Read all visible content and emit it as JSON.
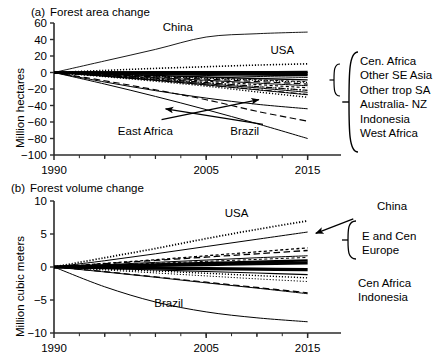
{
  "figure": {
    "width": 442,
    "height": 359,
    "background": "#ffffff",
    "line_color": "#000000"
  },
  "chart_data": [
    {
      "type": "line",
      "panel_tag": "(a)",
      "title": "Forest area change",
      "xlabel": "",
      "ylabel": "Million hectares",
      "xlim": [
        1990,
        2017.5
      ],
      "ylim": [
        -100,
        60
      ],
      "yticks": [
        60,
        40,
        20,
        0,
        -20,
        -40,
        -60,
        -80,
        -100
      ],
      "ytick_labels": [
        "60",
        "40",
        "20",
        "0",
        "−20",
        "−40",
        "−60",
        "−80",
        "−100"
      ],
      "xticks": [
        1990,
        2005,
        2015
      ],
      "xtick_labels": [
        "1990",
        "2005",
        "2015"
      ],
      "xminor_ticks": [
        1995,
        2000,
        2010
      ],
      "grid": false,
      "legend_position": "right-brace",
      "x": [
        1990,
        1995,
        2000,
        2005,
        2010,
        2015
      ],
      "series": [
        {
          "name": "China",
          "style": "solid",
          "width": 0.9,
          "values": [
            0,
            14,
            28,
            43,
            47,
            49
          ]
        },
        {
          "name": "USA",
          "style": "dotted",
          "width": 1.6,
          "values": [
            0,
            2.5,
            5,
            7,
            9,
            10.5
          ]
        },
        {
          "name": "Cen. Africa",
          "style": "solid",
          "width": 1.0,
          "values": [
            0,
            -1.2,
            -2.4,
            -3.6,
            -4.8,
            -6.0
          ]
        },
        {
          "name": "Other SE Asia",
          "style": "dashed-long",
          "width": 1.2,
          "values": [
            0,
            -2.6,
            -5.2,
            -8.0,
            -11.0,
            -14.0
          ]
        },
        {
          "name": "Other trop SA",
          "style": "dashed-short",
          "width": 1.2,
          "values": [
            0,
            -3.4,
            -7.0,
            -10.6,
            -14.6,
            -18.5
          ]
        },
        {
          "name": "Australia- NZ",
          "style": "dash-dot",
          "width": 1.1,
          "values": [
            0,
            -3.6,
            -7.6,
            -12.2,
            -17.0,
            -21.5
          ]
        },
        {
          "name": "Indonesia",
          "style": "dotted",
          "width": 1.4,
          "values": [
            0,
            -5.0,
            -10.5,
            -16.5,
            -23.5,
            -30.0
          ]
        },
        {
          "name": "West Africa",
          "style": "solid",
          "width": 1.0,
          "values": [
            0,
            -4.5,
            -9.5,
            -15.0,
            -21.0,
            -27.0
          ]
        },
        {
          "name": "East Africa",
          "style": "solid",
          "width": 1.0,
          "values": [
            0,
            -11.5,
            -22.0,
            -31.0,
            -38.5,
            -44.0
          ]
        },
        {
          "name": "Brazil",
          "style": "dashed-long",
          "width": 1.1,
          "values": [
            0,
            -10.0,
            -21.0,
            -33.0,
            -47.0,
            -59.0
          ]
        },
        {
          "name": "Brazil (lower)",
          "style": "solid",
          "width": 1.0,
          "values": [
            0,
            -14.0,
            -29.0,
            -45.0,
            -62.0,
            -80.0
          ]
        },
        {
          "name": "bundle-1",
          "style": "solid",
          "width": 2.6,
          "values": [
            0,
            -0.6,
            -1.2,
            -1.8,
            -2.4,
            -3.0
          ]
        },
        {
          "name": "bundle-2",
          "style": "solid",
          "width": 2.6,
          "values": [
            0,
            -0.2,
            -0.4,
            -0.6,
            -0.8,
            -1.0
          ]
        },
        {
          "name": "bundle-3",
          "style": "solid",
          "width": 2.2,
          "values": [
            0,
            0.2,
            0.4,
            0.5,
            0.6,
            0.7
          ]
        },
        {
          "name": "bundle-4",
          "style": "solid",
          "width": 1.4,
          "values": [
            0,
            -1.8,
            -3.6,
            -5.4,
            -7.2,
            -9.0
          ]
        },
        {
          "name": "bundle-5",
          "style": "dotted",
          "width": 1.2,
          "values": [
            0,
            -2.2,
            -4.6,
            -7.0,
            -9.4,
            -12.0
          ]
        },
        {
          "name": "bundle-6",
          "style": "dashed-short",
          "width": 1.0,
          "values": [
            0,
            -2.0,
            -4.2,
            -6.4,
            -8.8,
            -11.2
          ]
        },
        {
          "name": "bundle-7",
          "style": "solid",
          "width": 1.0,
          "values": [
            0,
            -3.0,
            -6.2,
            -9.4,
            -12.8,
            -16.0
          ]
        },
        {
          "name": "bundle-8",
          "style": "dotted",
          "width": 1.2,
          "values": [
            0,
            -3.8,
            -8.0,
            -12.4,
            -17.0,
            -21.8
          ]
        },
        {
          "name": "bundle-9",
          "style": "solid",
          "width": 1.0,
          "values": [
            0,
            -4.2,
            -8.8,
            -13.6,
            -18.6,
            -24.0
          ]
        },
        {
          "name": "bundle-10",
          "style": "dash-dot",
          "width": 1.0,
          "values": [
            0,
            -4.6,
            -9.6,
            -15.0,
            -20.6,
            -26.5
          ]
        }
      ],
      "inline_labels": [
        {
          "text": "China",
          "x": 2002.2,
          "y": 50.5
        },
        {
          "text": "USA",
          "x": 2012.5,
          "y": 22.0
        },
        {
          "text": "East Africa",
          "x": 1999.0,
          "y": -76.0
        },
        {
          "text": "Brazil",
          "x": 2008.8,
          "y": -76.0
        }
      ],
      "right_labels": [
        "Cen. Africa",
        "Other SE Asia",
        "Other trop SA",
        "Australia- NZ",
        "Indonesia",
        "West Africa"
      ],
      "arrows": [
        {
          "from": [
            2000.6,
            -57.0
          ],
          "to": [
            2010.2,
            -33.0
          ]
        },
        {
          "from": [
            2010.6,
            -63.0
          ],
          "to": [
            2001.0,
            -44.0
          ]
        }
      ]
    },
    {
      "type": "line",
      "panel_tag": "(b)",
      "title": "Forest volume change",
      "xlabel": "",
      "ylabel": "Million cubic meters",
      "xlim": [
        1990,
        2017.5
      ],
      "ylim": [
        -10,
        10
      ],
      "yticks": [
        10,
        5,
        0,
        -5,
        -10
      ],
      "ytick_labels": [
        "10",
        "5",
        "0",
        "−5",
        "−10"
      ],
      "xticks": [
        1990,
        2005,
        2015
      ],
      "xtick_labels": [
        "1990",
        "2005",
        "2015"
      ],
      "xminor_ticks": [
        1995,
        2000,
        2010
      ],
      "grid": false,
      "legend_position": "right-brace",
      "x": [
        1990,
        1995,
        2000,
        2005,
        2010,
        2015
      ],
      "series": [
        {
          "name": "USA",
          "style": "dotted",
          "width": 1.8,
          "values": [
            0,
            1.4,
            2.8,
            4.3,
            5.7,
            7.0
          ]
        },
        {
          "name": "China",
          "style": "solid",
          "width": 1.0,
          "values": [
            0,
            0.95,
            2.0,
            3.1,
            4.2,
            5.3
          ]
        },
        {
          "name": "E and Cen Europe (a)",
          "style": "dashed-short",
          "width": 1.3,
          "values": [
            0,
            0.55,
            1.1,
            1.7,
            2.3,
            2.9
          ]
        },
        {
          "name": "E and Cen Europe (b)",
          "style": "dashed-long",
          "width": 1.3,
          "values": [
            0,
            0.5,
            1.0,
            1.5,
            2.0,
            2.5
          ]
        },
        {
          "name": "Cen Africa",
          "style": "dashed-long",
          "width": 1.2,
          "values": [
            0,
            -0.7,
            -1.5,
            -2.3,
            -3.1,
            -3.9
          ]
        },
        {
          "name": "Indonesia",
          "style": "solid",
          "width": 1.0,
          "values": [
            0,
            -0.75,
            -1.55,
            -2.4,
            -3.2,
            -4.05
          ]
        },
        {
          "name": "Brazil",
          "style": "solid",
          "width": 1.0,
          "values": [
            0,
            -3.0,
            -5.3,
            -6.8,
            -7.7,
            -8.3
          ]
        },
        {
          "name": "bundle-1",
          "style": "solid",
          "width": 3.2,
          "values": [
            0,
            0.12,
            0.25,
            0.37,
            0.5,
            0.62
          ]
        },
        {
          "name": "bundle-2",
          "style": "solid",
          "width": 3.2,
          "values": [
            0,
            -0.08,
            -0.16,
            -0.24,
            -0.32,
            -0.4
          ]
        },
        {
          "name": "bundle-3",
          "style": "solid",
          "width": 2.4,
          "values": [
            0,
            0.2,
            0.4,
            0.6,
            0.8,
            1.0
          ]
        },
        {
          "name": "bundle-4",
          "style": "dotted",
          "width": 1.4,
          "values": [
            0,
            -0.3,
            -0.62,
            -0.95,
            -1.3,
            -1.65
          ]
        },
        {
          "name": "bundle-5",
          "style": "solid",
          "width": 1.1,
          "values": [
            0,
            -0.22,
            -0.45,
            -0.68,
            -0.92,
            -1.15
          ]
        },
        {
          "name": "bundle-6",
          "style": "dashed-short",
          "width": 1.0,
          "values": [
            0,
            0.28,
            0.56,
            0.85,
            1.15,
            1.45
          ]
        },
        {
          "name": "bundle-7",
          "style": "solid",
          "width": 1.0,
          "values": [
            0,
            0.35,
            0.7,
            1.05,
            1.4,
            1.7
          ]
        },
        {
          "name": "bundle-8",
          "style": "dotted",
          "width": 1.0,
          "values": [
            0,
            -0.45,
            -0.9,
            -1.35,
            -1.8,
            -2.2
          ]
        }
      ],
      "inline_labels": [
        {
          "text": "USA",
          "x": 2008.0,
          "y": 7.6
        },
        {
          "text": "Brazil",
          "x": 2001.3,
          "y": -6.1
        }
      ],
      "right_labels": [
        "China",
        "E and Cen",
        "Europe",
        "Cen Africa",
        "Indonesia"
      ],
      "arrows": [
        {
          "from": [
            2019.5,
            7.3
          ],
          "to": [
            2015.8,
            5.1
          ]
        }
      ]
    }
  ]
}
